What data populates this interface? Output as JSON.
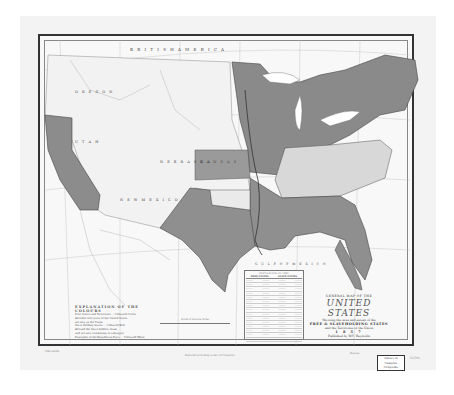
{
  "map": {
    "title_small": "GENERAL MAP OF THE",
    "title_main": "UNITED STATES",
    "title_sub1": "Showing the area and extent of the",
    "title_sub2": "FREE & SLAVEHOLDING STATES",
    "title_sub3": "and the Territories of the Union",
    "title_year": "1 8 5 7",
    "title_credit": "Published by W.C. Reynolds",
    "region_labels": {
      "british_america": "B R I T I S H   A M E R I C A",
      "kansas": "K A N S A S",
      "nebraska": "N E B R A S K A",
      "utah": "U T A H",
      "new_mexico": "N E W   M E X I C O",
      "oregon": "O R E G O N",
      "gulf": "G U L F   O F   M E X I C O"
    },
    "colors": {
      "free_states": "#8c8c8c",
      "slave_states": "#8f8f8f",
      "territories": "#f4f4f4",
      "kansas": "#9a9a9a",
      "border_states": "#d8d8d8",
      "water": "#ffffff"
    }
  },
  "legend": {
    "heading": "EXPLANATION OF THE COLOURS",
    "rows": [
      "Free States and Territories ... Coloured Green",
      "All other free parts of the United States",
      "not now in the Union",
      "Slave Holding States ... Coloured Red",
      "All land the Slave-holders claim",
      "and are now attempting to subjugate",
      "Principles of the Republican Party ... Coloured White"
    ]
  },
  "population_table": {
    "caption": "POPULATION OF 1850",
    "headers": [
      "FREE STATES",
      "SLAVE STATES"
    ],
    "rows": 15
  },
  "scale": {
    "label": "Scale of Statute Miles"
  },
  "footer": {
    "left_note": "V.Reynolds",
    "center_note": "Entered according to Act of Congress",
    "right_note": "Kansas",
    "stamp_lines": [
      "Library of",
      "Congress",
      "Geography"
    ],
    "margin_note": "G3701"
  }
}
